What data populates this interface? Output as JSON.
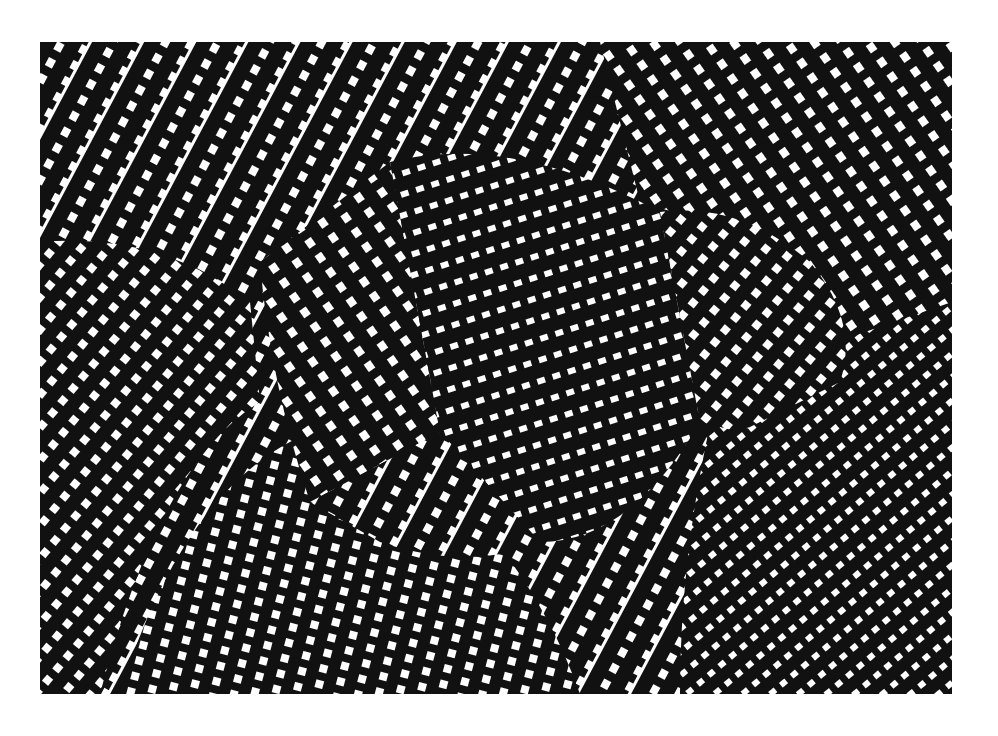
{
  "artwork": {
    "description": "Black and white op-art pattern of tilted dashed stripes forming warped surfaces and a central box-like form",
    "colors": {
      "ink": "#111111",
      "paper": "#ffffff"
    },
    "frame": {
      "x": 40,
      "y": 42,
      "width": 912,
      "height": 652
    }
  }
}
